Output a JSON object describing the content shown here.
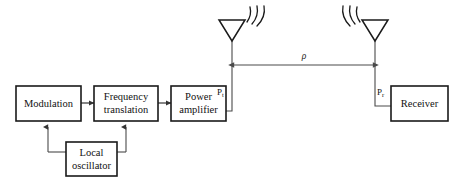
{
  "diagram": {
    "colors": {
      "background": "#ffffff",
      "box_stroke": "#1a1a1a",
      "wire": "#4a4a4a",
      "text": "#111111"
    },
    "blocks": [
      {
        "id": "modulation",
        "lines": [
          "Modulation"
        ],
        "line1": "Modulation",
        "line2": ""
      },
      {
        "id": "frequency-translation",
        "lines": [
          "Frequency",
          "translation"
        ],
        "line1": "Frequency",
        "line2": "translation"
      },
      {
        "id": "power-amplifier",
        "lines": [
          "Power",
          "amplifier"
        ],
        "line1": "Power",
        "line2": "amplifier"
      },
      {
        "id": "local-oscillator",
        "lines": [
          "Local",
          "oscillator"
        ],
        "line1": "Local",
        "line2": "oscillator"
      },
      {
        "id": "receiver",
        "lines": [
          "Receiver"
        ],
        "line1": "Receiver",
        "line2": ""
      }
    ],
    "labels": {
      "transmit_power_symbol": "P",
      "transmit_power_subscript": "t",
      "receive_power_symbol": "P",
      "receive_power_subscript": "r",
      "distance": "ρ"
    },
    "antennas": [
      {
        "id": "transmit-antenna",
        "radiation_arcs": 3,
        "arc_side": "right"
      },
      {
        "id": "receive-antenna",
        "radiation_arcs": 3,
        "arc_side": "left"
      }
    ]
  }
}
